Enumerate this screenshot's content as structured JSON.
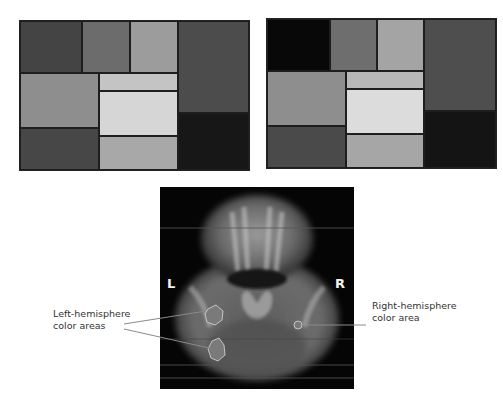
{
  "figure": {
    "panels": [
      {
        "name": "mondrian-left",
        "rect": {
          "x": 19,
          "y": 20,
          "w": 229,
          "h": 149
        },
        "cells": [
          {
            "x": 0,
            "y": 0,
            "w": 62,
            "h": 52,
            "color": "#444444"
          },
          {
            "x": 62,
            "y": 0,
            "w": 48,
            "h": 52,
            "color": "#6c6c6c"
          },
          {
            "x": 110,
            "y": 0,
            "w": 48,
            "h": 52,
            "color": "#9c9c9c"
          },
          {
            "x": 158,
            "y": 0,
            "w": 71,
            "h": 92,
            "color": "#4c4c4c"
          },
          {
            "x": 0,
            "y": 52,
            "w": 79,
            "h": 55,
            "color": "#8e8e8e"
          },
          {
            "x": 79,
            "y": 52,
            "w": 79,
            "h": 18,
            "color": "#c4c4c4"
          },
          {
            "x": 79,
            "y": 70,
            "w": 79,
            "h": 45,
            "color": "#d6d6d6"
          },
          {
            "x": 158,
            "y": 92,
            "w": 71,
            "h": 57,
            "color": "#171717"
          },
          {
            "x": 0,
            "y": 107,
            "w": 79,
            "h": 42,
            "color": "#474747"
          },
          {
            "x": 79,
            "y": 115,
            "w": 79,
            "h": 34,
            "color": "#a8a8a8"
          }
        ]
      },
      {
        "name": "mondrian-right",
        "rect": {
          "x": 266,
          "y": 18,
          "w": 229,
          "h": 149
        },
        "cells": [
          {
            "x": 0,
            "y": 0,
            "w": 63,
            "h": 52,
            "color": "#080808"
          },
          {
            "x": 63,
            "y": 0,
            "w": 47,
            "h": 52,
            "color": "#6e6e6e"
          },
          {
            "x": 110,
            "y": 0,
            "w": 47,
            "h": 52,
            "color": "#a4a4a4"
          },
          {
            "x": 157,
            "y": 0,
            "w": 72,
            "h": 92,
            "color": "#4e4e4e"
          },
          {
            "x": 0,
            "y": 52,
            "w": 79,
            "h": 55,
            "color": "#8e8e8e"
          },
          {
            "x": 79,
            "y": 52,
            "w": 78,
            "h": 18,
            "color": "#b8b8b8"
          },
          {
            "x": 79,
            "y": 70,
            "w": 78,
            "h": 45,
            "color": "#dcdcdc"
          },
          {
            "x": 157,
            "y": 92,
            "w": 72,
            "h": 57,
            "color": "#141414"
          },
          {
            "x": 0,
            "y": 107,
            "w": 79,
            "h": 42,
            "color": "#4a4a4a"
          },
          {
            "x": 79,
            "y": 115,
            "w": 78,
            "h": 34,
            "color": "#a6a6a6"
          }
        ]
      }
    ],
    "brain_scan": {
      "left_marker": "L",
      "right_marker": "R"
    },
    "annotations": {
      "left_label_line1": "Left-hemisphere",
      "left_label_line2": "color areas",
      "right_label_line1": "Right-hemisphere",
      "right_label_line2": "color area"
    }
  }
}
